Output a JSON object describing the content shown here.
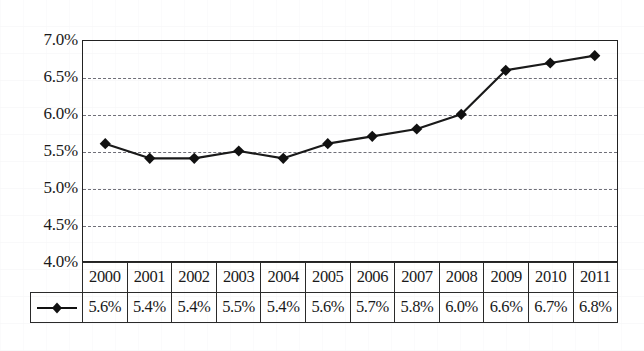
{
  "chart_data": {
    "type": "line",
    "title": "",
    "xlabel": "",
    "ylabel": "",
    "ylim": [
      4.0,
      7.0
    ],
    "ytick_values": [
      7.0,
      6.5,
      6.0,
      5.5,
      5.0,
      4.5,
      4.0
    ],
    "ytick_labels": [
      "7.0%",
      "6.5%",
      "6.0%",
      "5.5%",
      "5.0%",
      "4.5%",
      "4.0%"
    ],
    "grid": "horizontal-dashed",
    "legend_position": "table-row-header",
    "categories": [
      "2000",
      "2001",
      "2002",
      "2003",
      "2004",
      "2005",
      "2006",
      "2007",
      "2008",
      "2009",
      "2010",
      "2011"
    ],
    "values": [
      5.6,
      5.4,
      5.4,
      5.5,
      5.4,
      5.6,
      5.7,
      5.8,
      6.0,
      6.6,
      6.7,
      6.8
    ],
    "value_labels": [
      "5.6%",
      "5.4%",
      "5.4%",
      "5.5%",
      "5.4%",
      "5.6%",
      "5.7%",
      "5.8%",
      "6.0%",
      "6.6%",
      "6.7%",
      "6.8%"
    ],
    "marker": "diamond",
    "line_color": "#1a1a1a",
    "marker_color": "#111111",
    "gridline_color": "#6f6f78",
    "axis_color": "#222222"
  },
  "table": {
    "legend_cell_label": "",
    "header_row": [
      "2000",
      "2001",
      "2002",
      "2003",
      "2004",
      "2005",
      "2006",
      "2007",
      "2008",
      "2009",
      "2010",
      "2011"
    ],
    "value_row": [
      "5.6%",
      "5.4%",
      "5.4%",
      "5.5%",
      "5.4%",
      "5.6%",
      "5.7%",
      "5.8%",
      "6.0%",
      "6.6%",
      "6.7%",
      "6.8%"
    ]
  },
  "axis": {
    "y_labels": [
      "7.0%",
      "6.5%",
      "6.0%",
      "5.5%",
      "5.0%",
      "4.5%",
      "4.0%"
    ]
  }
}
